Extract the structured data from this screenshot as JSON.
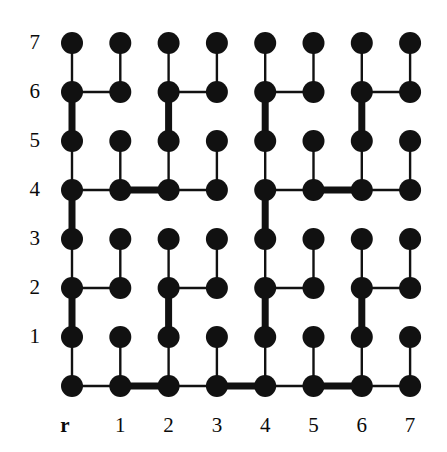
{
  "figure": {
    "background_color": "#ffffff",
    "ink_color": "#111111",
    "width": 447,
    "height": 452
  },
  "axes": {
    "row_labels": [
      "7",
      "6",
      "5",
      "4",
      "3",
      "2",
      "1"
    ],
    "column_labels": [
      "1",
      "2",
      "3",
      "4",
      "5",
      "6",
      "7"
    ],
    "root_label": "r"
  },
  "chart_data": {
    "type": "scatter",
    "xlabel": "",
    "ylabel": "",
    "grid": false,
    "legend": null,
    "xlim": [
      0,
      7
    ],
    "ylim": [
      0,
      7
    ],
    "x_tick_labels": [
      "1",
      "2",
      "3",
      "4",
      "5",
      "6",
      "7"
    ],
    "x_tick_values": [
      1,
      2,
      3,
      4,
      5,
      6,
      7
    ],
    "y_tick_labels": [
      "1",
      "2",
      "3",
      "4",
      "5",
      "6",
      "7"
    ],
    "y_tick_values": [
      1,
      2,
      3,
      4,
      5,
      6,
      7
    ],
    "root_column_label": "r",
    "root_column_index": 0,
    "node_count": 64,
    "node_marker": "filled-circle",
    "node_radius_px": 11,
    "columns": [
      0,
      1,
      2,
      3,
      4,
      5,
      6,
      7
    ],
    "rows": [
      0,
      1,
      2,
      3,
      4,
      5,
      6,
      7
    ],
    "nodes": [
      {
        "col": 0,
        "row": 0
      },
      {
        "col": 0,
        "row": 1
      },
      {
        "col": 0,
        "row": 2
      },
      {
        "col": 0,
        "row": 3
      },
      {
        "col": 0,
        "row": 4
      },
      {
        "col": 0,
        "row": 5
      },
      {
        "col": 0,
        "row": 6
      },
      {
        "col": 0,
        "row": 7
      },
      {
        "col": 1,
        "row": 0
      },
      {
        "col": 1,
        "row": 1
      },
      {
        "col": 1,
        "row": 2
      },
      {
        "col": 1,
        "row": 3
      },
      {
        "col": 1,
        "row": 4
      },
      {
        "col": 1,
        "row": 5
      },
      {
        "col": 1,
        "row": 6
      },
      {
        "col": 1,
        "row": 7
      },
      {
        "col": 2,
        "row": 0
      },
      {
        "col": 2,
        "row": 1
      },
      {
        "col": 2,
        "row": 2
      },
      {
        "col": 2,
        "row": 3
      },
      {
        "col": 2,
        "row": 4
      },
      {
        "col": 2,
        "row": 5
      },
      {
        "col": 2,
        "row": 6
      },
      {
        "col": 2,
        "row": 7
      },
      {
        "col": 3,
        "row": 0
      },
      {
        "col": 3,
        "row": 1
      },
      {
        "col": 3,
        "row": 2
      },
      {
        "col": 3,
        "row": 3
      },
      {
        "col": 3,
        "row": 4
      },
      {
        "col": 3,
        "row": 5
      },
      {
        "col": 3,
        "row": 6
      },
      {
        "col": 3,
        "row": 7
      },
      {
        "col": 4,
        "row": 0
      },
      {
        "col": 4,
        "row": 1
      },
      {
        "col": 4,
        "row": 2
      },
      {
        "col": 4,
        "row": 3
      },
      {
        "col": 4,
        "row": 4
      },
      {
        "col": 4,
        "row": 5
      },
      {
        "col": 4,
        "row": 6
      },
      {
        "col": 4,
        "row": 7
      },
      {
        "col": 5,
        "row": 0
      },
      {
        "col": 5,
        "row": 1
      },
      {
        "col": 5,
        "row": 2
      },
      {
        "col": 5,
        "row": 3
      },
      {
        "col": 5,
        "row": 4
      },
      {
        "col": 5,
        "row": 5
      },
      {
        "col": 5,
        "row": 6
      },
      {
        "col": 5,
        "row": 7
      },
      {
        "col": 6,
        "row": 0
      },
      {
        "col": 6,
        "row": 1
      },
      {
        "col": 6,
        "row": 2
      },
      {
        "col": 6,
        "row": 3
      },
      {
        "col": 6,
        "row": 4
      },
      {
        "col": 6,
        "row": 5
      },
      {
        "col": 6,
        "row": 6
      },
      {
        "col": 6,
        "row": 7
      },
      {
        "col": 7,
        "row": 0
      },
      {
        "col": 7,
        "row": 1
      },
      {
        "col": 7,
        "row": 2
      },
      {
        "col": 7,
        "row": 3
      },
      {
        "col": 7,
        "row": 4
      },
      {
        "col": 7,
        "row": 5
      },
      {
        "col": 7,
        "row": 6
      },
      {
        "col": 7,
        "row": 7
      }
    ],
    "edges": [
      {
        "from": [
          0,
          7
        ],
        "to": [
          0,
          6
        ],
        "orientation": "vertical",
        "weight": "thin"
      },
      {
        "from": [
          0,
          6
        ],
        "to": [
          0,
          5
        ],
        "orientation": "vertical",
        "weight": "thick"
      },
      {
        "from": [
          0,
          5
        ],
        "to": [
          0,
          4
        ],
        "orientation": "vertical",
        "weight": "thin"
      },
      {
        "from": [
          0,
          4
        ],
        "to": [
          0,
          3
        ],
        "orientation": "vertical",
        "weight": "thick"
      },
      {
        "from": [
          0,
          3
        ],
        "to": [
          0,
          2
        ],
        "orientation": "vertical",
        "weight": "thin"
      },
      {
        "from": [
          0,
          2
        ],
        "to": [
          0,
          1
        ],
        "orientation": "vertical",
        "weight": "thick"
      },
      {
        "from": [
          0,
          1
        ],
        "to": [
          0,
          0
        ],
        "orientation": "vertical",
        "weight": "thin"
      },
      {
        "from": [
          1,
          7
        ],
        "to": [
          1,
          6
        ],
        "orientation": "vertical",
        "weight": "thin"
      },
      {
        "from": [
          1,
          5
        ],
        "to": [
          1,
          4
        ],
        "orientation": "vertical",
        "weight": "thin"
      },
      {
        "from": [
          1,
          3
        ],
        "to": [
          1,
          2
        ],
        "orientation": "vertical",
        "weight": "thin"
      },
      {
        "from": [
          1,
          1
        ],
        "to": [
          1,
          0
        ],
        "orientation": "vertical",
        "weight": "thin"
      },
      {
        "from": [
          2,
          7
        ],
        "to": [
          2,
          6
        ],
        "orientation": "vertical",
        "weight": "thin"
      },
      {
        "from": [
          2,
          6
        ],
        "to": [
          2,
          5
        ],
        "orientation": "vertical",
        "weight": "thick"
      },
      {
        "from": [
          2,
          5
        ],
        "to": [
          2,
          4
        ],
        "orientation": "vertical",
        "weight": "thin"
      },
      {
        "from": [
          2,
          3
        ],
        "to": [
          2,
          2
        ],
        "orientation": "vertical",
        "weight": "thin"
      },
      {
        "from": [
          2,
          2
        ],
        "to": [
          2,
          1
        ],
        "orientation": "vertical",
        "weight": "thick"
      },
      {
        "from": [
          2,
          1
        ],
        "to": [
          2,
          0
        ],
        "orientation": "vertical",
        "weight": "thin"
      },
      {
        "from": [
          3,
          7
        ],
        "to": [
          3,
          6
        ],
        "orientation": "vertical",
        "weight": "thin"
      },
      {
        "from": [
          3,
          5
        ],
        "to": [
          3,
          4
        ],
        "orientation": "vertical",
        "weight": "thin"
      },
      {
        "from": [
          3,
          3
        ],
        "to": [
          3,
          2
        ],
        "orientation": "vertical",
        "weight": "thin"
      },
      {
        "from": [
          3,
          1
        ],
        "to": [
          3,
          0
        ],
        "orientation": "vertical",
        "weight": "thin"
      },
      {
        "from": [
          4,
          7
        ],
        "to": [
          4,
          6
        ],
        "orientation": "vertical",
        "weight": "thin"
      },
      {
        "from": [
          4,
          6
        ],
        "to": [
          4,
          5
        ],
        "orientation": "vertical",
        "weight": "thick"
      },
      {
        "from": [
          4,
          5
        ],
        "to": [
          4,
          4
        ],
        "orientation": "vertical",
        "weight": "thin"
      },
      {
        "from": [
          4,
          4
        ],
        "to": [
          4,
          3
        ],
        "orientation": "vertical",
        "weight": "thick"
      },
      {
        "from": [
          4,
          3
        ],
        "to": [
          4,
          2
        ],
        "orientation": "vertical",
        "weight": "thin"
      },
      {
        "from": [
          4,
          2
        ],
        "to": [
          4,
          1
        ],
        "orientation": "vertical",
        "weight": "thick"
      },
      {
        "from": [
          4,
          1
        ],
        "to": [
          4,
          0
        ],
        "orientation": "vertical",
        "weight": "thin"
      },
      {
        "from": [
          5,
          7
        ],
        "to": [
          5,
          6
        ],
        "orientation": "vertical",
        "weight": "thin"
      },
      {
        "from": [
          5,
          5
        ],
        "to": [
          5,
          4
        ],
        "orientation": "vertical",
        "weight": "thin"
      },
      {
        "from": [
          5,
          3
        ],
        "to": [
          5,
          2
        ],
        "orientation": "vertical",
        "weight": "thin"
      },
      {
        "from": [
          5,
          1
        ],
        "to": [
          5,
          0
        ],
        "orientation": "vertical",
        "weight": "thin"
      },
      {
        "from": [
          6,
          7
        ],
        "to": [
          6,
          6
        ],
        "orientation": "vertical",
        "weight": "thin"
      },
      {
        "from": [
          6,
          6
        ],
        "to": [
          6,
          5
        ],
        "orientation": "vertical",
        "weight": "thick"
      },
      {
        "from": [
          6,
          5
        ],
        "to": [
          6,
          4
        ],
        "orientation": "vertical",
        "weight": "thin"
      },
      {
        "from": [
          6,
          3
        ],
        "to": [
          6,
          2
        ],
        "orientation": "vertical",
        "weight": "thin"
      },
      {
        "from": [
          6,
          2
        ],
        "to": [
          6,
          1
        ],
        "orientation": "vertical",
        "weight": "thick"
      },
      {
        "from": [
          6,
          1
        ],
        "to": [
          6,
          0
        ],
        "orientation": "vertical",
        "weight": "thin"
      },
      {
        "from": [
          7,
          7
        ],
        "to": [
          7,
          6
        ],
        "orientation": "vertical",
        "weight": "thin"
      },
      {
        "from": [
          7,
          5
        ],
        "to": [
          7,
          4
        ],
        "orientation": "vertical",
        "weight": "thin"
      },
      {
        "from": [
          7,
          3
        ],
        "to": [
          7,
          2
        ],
        "orientation": "vertical",
        "weight": "thin"
      },
      {
        "from": [
          7,
          1
        ],
        "to": [
          7,
          0
        ],
        "orientation": "vertical",
        "weight": "thin"
      },
      {
        "from": [
          0,
          6
        ],
        "to": [
          1,
          6
        ],
        "orientation": "horizontal",
        "weight": "thin"
      },
      {
        "from": [
          2,
          6
        ],
        "to": [
          3,
          6
        ],
        "orientation": "horizontal",
        "weight": "thin"
      },
      {
        "from": [
          4,
          6
        ],
        "to": [
          5,
          6
        ],
        "orientation": "horizontal",
        "weight": "thin"
      },
      {
        "from": [
          6,
          6
        ],
        "to": [
          7,
          6
        ],
        "orientation": "horizontal",
        "weight": "thin"
      },
      {
        "from": [
          0,
          4
        ],
        "to": [
          1,
          4
        ],
        "orientation": "horizontal",
        "weight": "thin"
      },
      {
        "from": [
          1,
          4
        ],
        "to": [
          2,
          4
        ],
        "orientation": "horizontal",
        "weight": "thick"
      },
      {
        "from": [
          2,
          4
        ],
        "to": [
          3,
          4
        ],
        "orientation": "horizontal",
        "weight": "thin"
      },
      {
        "from": [
          4,
          4
        ],
        "to": [
          5,
          4
        ],
        "orientation": "horizontal",
        "weight": "thin"
      },
      {
        "from": [
          5,
          4
        ],
        "to": [
          6,
          4
        ],
        "orientation": "horizontal",
        "weight": "thick"
      },
      {
        "from": [
          6,
          4
        ],
        "to": [
          7,
          4
        ],
        "orientation": "horizontal",
        "weight": "thin"
      },
      {
        "from": [
          0,
          2
        ],
        "to": [
          1,
          2
        ],
        "orientation": "horizontal",
        "weight": "thin"
      },
      {
        "from": [
          2,
          2
        ],
        "to": [
          3,
          2
        ],
        "orientation": "horizontal",
        "weight": "thin"
      },
      {
        "from": [
          4,
          2
        ],
        "to": [
          5,
          2
        ],
        "orientation": "horizontal",
        "weight": "thin"
      },
      {
        "from": [
          6,
          2
        ],
        "to": [
          7,
          2
        ],
        "orientation": "horizontal",
        "weight": "thin"
      },
      {
        "from": [
          0,
          0
        ],
        "to": [
          1,
          0
        ],
        "orientation": "horizontal",
        "weight": "thin"
      },
      {
        "from": [
          1,
          0
        ],
        "to": [
          2,
          0
        ],
        "orientation": "horizontal",
        "weight": "thick"
      },
      {
        "from": [
          2,
          0
        ],
        "to": [
          3,
          0
        ],
        "orientation": "horizontal",
        "weight": "thin"
      },
      {
        "from": [
          3,
          0
        ],
        "to": [
          4,
          0
        ],
        "orientation": "horizontal",
        "weight": "thick"
      },
      {
        "from": [
          4,
          0
        ],
        "to": [
          5,
          0
        ],
        "orientation": "horizontal",
        "weight": "thin"
      },
      {
        "from": [
          5,
          0
        ],
        "to": [
          6,
          0
        ],
        "orientation": "horizontal",
        "weight": "thick"
      },
      {
        "from": [
          6,
          0
        ],
        "to": [
          7,
          0
        ],
        "orientation": "horizontal",
        "weight": "thin"
      }
    ],
    "geometry": {
      "origin_x": 72,
      "origin_y": 386,
      "col_spacing": 48.3,
      "row_spacing": 49.0,
      "thin_width_px": 2.4,
      "thick_width_px": 7.0
    }
  }
}
